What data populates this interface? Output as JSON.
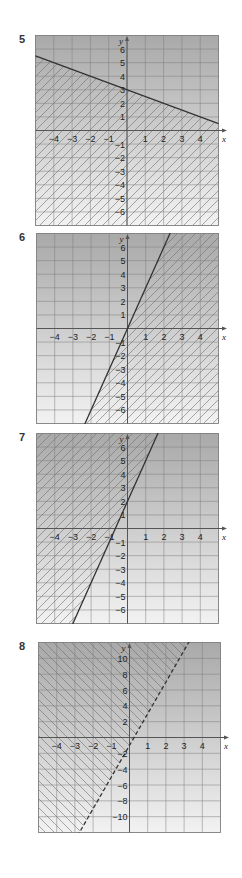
{
  "exercises": [
    {
      "number": "5",
      "frame": {
        "left": 35,
        "top": 35,
        "width": 183,
        "height": 190
      },
      "x_range": [
        -5,
        5
      ],
      "y_range": [
        -7,
        7
      ],
      "x_ticks": [
        "-4",
        "-3",
        "-2",
        "-1",
        "1",
        "2",
        "3",
        "4"
      ],
      "y_ticks": [
        "6",
        "5",
        "4",
        "3",
        "2",
        "1",
        "-1",
        "-2",
        "-3",
        "-4",
        "-5",
        "-6"
      ],
      "y_step": 1,
      "x_label": "x",
      "y_label": "y",
      "boundary": {
        "slope": -0.5,
        "intercept": 3,
        "style": "solid"
      },
      "shaded_side": "below",
      "hatch": "forward"
    },
    {
      "number": "6",
      "frame": {
        "left": 36,
        "top": 233,
        "width": 182,
        "height": 190
      },
      "x_range": [
        -5,
        5
      ],
      "y_range": [
        -7,
        7
      ],
      "x_ticks": [
        "-4",
        "-3",
        "-2",
        "-1",
        "1",
        "2",
        "3",
        "4"
      ],
      "y_ticks": [
        "6",
        "5",
        "4",
        "3",
        "2",
        "1",
        "-1",
        "-2",
        "-3",
        "-4",
        "-5",
        "-6"
      ],
      "y_step": 1,
      "x_label": "x",
      "y_label": "y",
      "boundary": {
        "slope": 3,
        "intercept": 0,
        "style": "solid"
      },
      "shaded_side": "below",
      "hatch": "forward"
    },
    {
      "number": "7",
      "frame": {
        "left": 36,
        "top": 433,
        "width": 182,
        "height": 190
      },
      "x_range": [
        -5,
        5
      ],
      "y_range": [
        -7,
        7
      ],
      "x_ticks": [
        "-4",
        "-3",
        "-2",
        "-1",
        "1",
        "2",
        "3",
        "4"
      ],
      "y_ticks": [
        "6",
        "5",
        "4",
        "3",
        "2",
        "1",
        "-1",
        "-2",
        "-3",
        "-4",
        "-5",
        "-6"
      ],
      "y_step": 1,
      "x_label": "x",
      "y_label": "y",
      "boundary": {
        "slope": 3,
        "intercept": 2,
        "style": "solid"
      },
      "shaded_side": "above",
      "hatch": "forward"
    },
    {
      "number": "8",
      "frame": {
        "left": 38,
        "top": 642,
        "width": 182,
        "height": 190
      },
      "x_range": [
        -5,
        5
      ],
      "y_range": [
        -12,
        12
      ],
      "x_ticks": [
        "-4",
        "-3",
        "-2",
        "-1",
        "1",
        "2",
        "3",
        "4"
      ],
      "y_ticks": [
        "10",
        "8",
        "6",
        "4",
        "2",
        "-2",
        "-4",
        "-6",
        "-8",
        "-10"
      ],
      "y_step": 2,
      "x_label": "x",
      "y_label": "y",
      "boundary": {
        "slope": 4,
        "intercept": -1,
        "style": "dashed"
      },
      "shaded_side": "above",
      "hatch": "backward"
    }
  ],
  "colors": {
    "grad_top": "#a9a9a9",
    "grad_bottom": "#f2f2f2",
    "grid": "#7d7d7d",
    "line": "#333333",
    "hatch": "#6f6f6f"
  }
}
